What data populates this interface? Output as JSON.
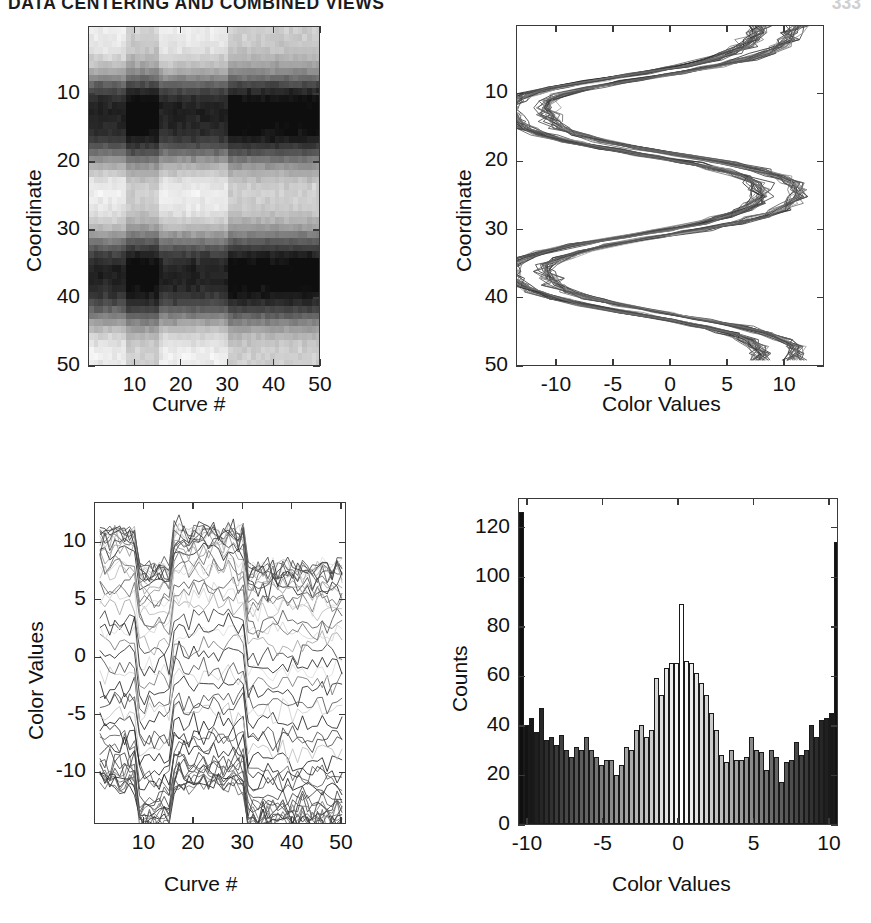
{
  "runhead": {
    "title": "DATA CENTERING AND COMBINED VIEWS",
    "page": "333"
  },
  "panels": {
    "heatmap": {
      "name": "Curve # vs Coordinate grayscale image",
      "xlabel": "Curve #",
      "ylabel": "Coordinate",
      "xticks": [
        "10",
        "20",
        "30",
        "40",
        "50"
      ],
      "yticks": [
        "10",
        "20",
        "30",
        "40",
        "50"
      ]
    },
    "coordinate_profile": {
      "name": "Color Values vs Coordinate line overlay",
      "xlabel": "Color Values",
      "ylabel": "Coordinate",
      "xticks": [
        "-10",
        "-5",
        "0",
        "5",
        "10"
      ],
      "yticks": [
        "10",
        "20",
        "30",
        "40",
        "50"
      ]
    },
    "parallel_curves": {
      "name": "Curve # vs Color Values parallel coordinates",
      "xlabel": "Curve #",
      "ylabel": "Color Values",
      "xticks": [
        "10",
        "20",
        "30",
        "40",
        "50"
      ],
      "yticks": [
        "10",
        "5",
        "0",
        "-5",
        "-10"
      ]
    },
    "histogram": {
      "name": "Counts of Color Values histogram",
      "xlabel": "Color Values",
      "ylabel": "Counts",
      "xticks": [
        "-10",
        "-5",
        "0",
        "5",
        "10"
      ],
      "yticks": [
        "0",
        "20",
        "40",
        "60",
        "80",
        "100",
        "120"
      ]
    }
  },
  "chart_data": [
    {
      "id": "heatmap",
      "type": "heatmap",
      "title": "",
      "xlabel": "Curve #",
      "ylabel": "Coordinate",
      "xlim": [
        0,
        50
      ],
      "ylim": [
        50,
        0
      ],
      "xticks": [
        10,
        20,
        30,
        40,
        50
      ],
      "yticks": [
        10,
        20,
        30,
        40,
        50
      ],
      "grid": false,
      "colormap": "gray",
      "clim": [
        -13,
        13
      ],
      "ncols": 50,
      "nrows": 50,
      "row_band_profile": [
        11.0,
        10.6,
        10.2,
        9.4,
        8.2,
        6.4,
        3.6,
        0.2,
        -3.6,
        -7.0,
        -9.4,
        -10.6,
        -11.0,
        -10.8,
        -10.4,
        -9.6,
        -8.0,
        -5.6,
        -2.4,
        1.2,
        4.6,
        7.4,
        9.4,
        10.6,
        11.0,
        10.9,
        10.4,
        9.4,
        7.8,
        5.4,
        2.2,
        -1.4,
        -4.8,
        -7.6,
        -9.6,
        -10.8,
        -11.0,
        -10.7,
        -10.0,
        -8.8,
        -6.8,
        -4.0,
        -0.8,
        2.6,
        5.8,
        8.2,
        9.8,
        10.7,
        11.0,
        10.8
      ],
      "col_offset_profile": [
        0.2,
        0.0,
        -0.2,
        0.3,
        0.1,
        -0.1,
        0.2,
        0.0,
        -3.2,
        -3.4,
        -3.0,
        -3.3,
        -3.1,
        -2.9,
        -3.2,
        -0.1,
        0.2,
        0.0,
        -0.2,
        0.1,
        0.0,
        0.2,
        -0.1,
        0.1,
        0.0,
        -0.2,
        0.2,
        0.1,
        -0.1,
        0.0,
        -3.3,
        -3.1,
        -3.4,
        -3.0,
        -3.2,
        -3.1,
        -3.3,
        -2.9,
        -3.2,
        -3.1,
        -3.3,
        -3.0,
        -3.2,
        -3.4,
        -3.1,
        -3.0,
        -3.3,
        -3.2,
        -2.9,
        -3.1
      ],
      "noise_amplitude": 1.6
    },
    {
      "id": "coordinate_profile",
      "type": "line",
      "title": "",
      "xlabel": "Color Values",
      "ylabel": "Coordinate",
      "xlim": [
        -13.5,
        13.5
      ],
      "ylim": [
        50,
        0
      ],
      "xticks": [
        -10,
        -5,
        0,
        5,
        10
      ],
      "yticks": [
        10,
        20,
        30,
        40,
        50
      ],
      "grid": false,
      "n_series": 50,
      "description": "Fifty noisy curves of color value plotted against coordinate index, forming two stacked diamond/rhombus envelopes with waists near coordinate 25 and 50.",
      "envelope_nodes": [
        {
          "coordinate": 0,
          "value": 0
        },
        {
          "coordinate": 12,
          "value": 11
        },
        {
          "coordinate": 25,
          "value": 0
        },
        {
          "coordinate": 37,
          "value": 11
        },
        {
          "coordinate": 50,
          "value": 0
        }
      ]
    },
    {
      "id": "parallel_curves",
      "type": "line",
      "title": "",
      "xlabel": "Curve #",
      "ylabel": "Color Values",
      "xlim": [
        0,
        51
      ],
      "ylim": [
        -14.5,
        13.5
      ],
      "xticks": [
        10,
        20,
        30,
        40,
        50
      ],
      "yticks": [
        -10,
        -5,
        0,
        5,
        10
      ],
      "grid": false,
      "n_series": 50,
      "description": "Fifty coordinate traces versus curve number; a block of curves drops from the +10 band to the -10 band between curve 9 and curve 31, and a lighter-shaded group rises between curve 16 and 31.",
      "segments": [
        {
          "x_start": 1,
          "x_end": 9,
          "band_high": 10,
          "band_low": 0,
          "shade": "dark"
        },
        {
          "x_start": 9,
          "x_end": 31,
          "band_high": 0,
          "band_low": -11,
          "shade": "dark"
        },
        {
          "x_start": 16,
          "x_end": 31,
          "band_high": 10,
          "band_low": 2,
          "shade": "light"
        },
        {
          "x_start": 31,
          "x_end": 50,
          "band_high": 10,
          "band_low": -11,
          "shade": "mixed"
        }
      ]
    },
    {
      "id": "histogram",
      "type": "bar",
      "title": "",
      "xlabel": "Color Values",
      "ylabel": "Counts",
      "xlim": [
        -10.6,
        10.6
      ],
      "ylim": [
        0,
        132
      ],
      "xticks": [
        -10,
        -5,
        0,
        5,
        10
      ],
      "yticks": [
        0,
        20,
        40,
        60,
        80,
        100,
        120
      ],
      "grid": false,
      "nbins": 64,
      "bin_centers": [
        -10.4,
        -10.1,
        -9.8,
        -9.4,
        -9.1,
        -8.8,
        -8.5,
        -8.1,
        -7.8,
        -7.5,
        -7.2,
        -6.8,
        -6.5,
        -6.2,
        -5.9,
        -5.5,
        -5.2,
        -4.9,
        -4.6,
        -4.2,
        -3.9,
        -3.6,
        -3.3,
        -2.9,
        -2.6,
        -2.3,
        -2.0,
        -1.6,
        -1.3,
        -1.0,
        -0.7,
        -0.3,
        0.0,
        0.3,
        0.7,
        1.0,
        1.3,
        1.6,
        2.0,
        2.3,
        2.6,
        2.9,
        3.3,
        3.6,
        3.9,
        4.2,
        4.6,
        4.9,
        5.2,
        5.5,
        5.9,
        6.2,
        6.5,
        6.8,
        7.2,
        7.5,
        7.8,
        8.1,
        8.5,
        8.8,
        9.1,
        9.4,
        9.8,
        10.2
      ],
      "values": [
        126,
        40,
        43,
        37,
        47,
        34,
        35,
        32,
        36,
        30,
        27,
        31,
        30,
        35,
        30,
        27,
        24,
        26,
        26,
        20,
        24,
        31,
        30,
        38,
        40,
        35,
        38,
        59,
        52,
        63,
        65,
        65,
        89,
        66,
        65,
        61,
        57,
        52,
        45,
        38,
        28,
        25,
        30,
        26,
        26,
        27,
        35,
        30,
        29,
        22,
        30,
        27,
        17,
        25,
        26,
        33,
        28,
        30,
        40,
        35,
        42,
        43,
        45,
        114
      ],
      "bar_shading": "grayscale ramp mirrored about zero: near-black at the color-value extremes, white at zero"
    }
  ]
}
